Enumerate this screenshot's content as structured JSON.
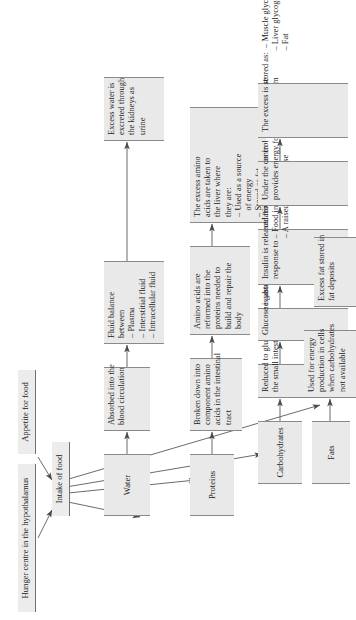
{
  "diagram": {
    "orientation": "rotated-90-ccw",
    "nodes": {
      "hunger_centre": "Hunger centre in the hypothalamus",
      "appetite": "Appetite for food",
      "intake": "Intake of food"
    },
    "columns": [
      {
        "id": "water",
        "header": "Water",
        "steps": [
          {
            "id": "water-1",
            "lines": [
              "Absorbed into the",
              "blood circulation"
            ]
          },
          {
            "id": "water-2",
            "lines": [
              "Fluid balance",
              "between",
              "– Plasma",
              "– Interstitial fluid",
              "– Intracellular fluid"
            ]
          },
          {
            "id": "water-3",
            "lines": [
              "Excess water is",
              "excreted through",
              "the kidneys as",
              "urine"
            ]
          }
        ]
      },
      {
        "id": "proteins",
        "header": "Proteins",
        "steps": [
          {
            "id": "proteins-1",
            "lines": [
              "Broken down into",
              "component amino",
              "acids in the intestinal",
              "tract"
            ]
          },
          {
            "id": "proteins-2",
            "lines": [
              "Amino acids are",
              "reformed into the",
              "proteins needed to",
              "build and repair the",
              "body"
            ]
          },
          {
            "id": "proteins-3",
            "lines": [
              "The excess amino",
              "acids are taken to",
              "the liver where",
              "they are:",
              "– Used as a source",
              "   of energy",
              "– Stored as fat"
            ]
          }
        ]
      },
      {
        "id": "carbohydrates",
        "header": "Carbohydrates",
        "steps": [
          {
            "id": "carbohydrates-1",
            "lines": [
              "Reduced to glucose by the gastric juices of",
              "the small intestine"
            ]
          },
          {
            "id": "carbohydrates-2",
            "lines": [
              "Glucose is absorbed into the circulating blood"
            ]
          },
          {
            "id": "carbohydrates-3",
            "lines": [
              "Insulin is released from the pancreas in",
              "response to – Food in the stomach",
              "                   – A raised blood glucose"
            ]
          },
          {
            "id": "carbohydrates-4",
            "lines": [
              "Under the control of insulin glucose",
              "provides energy for cell metabolism"
            ]
          },
          {
            "id": "carbohydrates-5",
            "lines": [
              "The excess is stored as:  – Muscle glycogen",
              "                                      – Liver glycogen",
              "                                      – Fat"
            ]
          }
        ]
      },
      {
        "id": "fats",
        "header": "Fats",
        "steps": [
          {
            "id": "fats-1",
            "lines": [
              "Used for energy",
              "production in cells",
              "when carbohydrates",
              "not available"
            ]
          },
          {
            "id": "fats-2",
            "lines": [
              "Excess fat stored in",
              "fat deposits"
            ]
          }
        ]
      }
    ],
    "colors": {
      "box_fill": "#e9e9e9",
      "box_border": "#8a8a8a",
      "arrow": "#4a4a4a",
      "text": "#1a1a1a",
      "background": "#ffffff"
    }
  }
}
